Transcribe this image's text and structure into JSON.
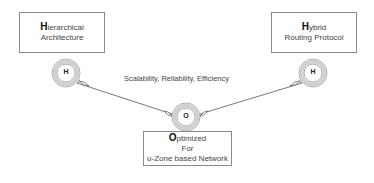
{
  "diagram": {
    "nodes": [
      {
        "id": "left",
        "title_initial": "H",
        "title_rest": "ierarchical",
        "subtitle": "Architecture",
        "circle_label": "H"
      },
      {
        "id": "right",
        "title_initial": "H",
        "title_rest": "ybrid",
        "subtitle": "Routing Protocol",
        "circle_label": "H"
      },
      {
        "id": "bottom",
        "title_initial": "O",
        "title_rest": "ptimized",
        "line2": "For",
        "line3": "u-Zone based Network",
        "circle_label": "O"
      }
    ],
    "edge_caption": "Scalability, Reliability, Efficiency"
  },
  "colors": {
    "ring": "#c8c8c8",
    "line": "#555555",
    "border": "#8a8a8a"
  }
}
